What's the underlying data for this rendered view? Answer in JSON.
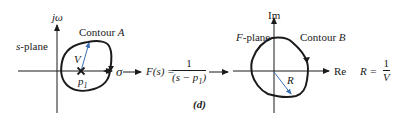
{
  "figure_label": "(d)",
  "s_plane": {
    "plane_label": "s-plane",
    "plane_label_var": "s",
    "plane_label_rest": "-plane",
    "vertical_axis_label": "jω",
    "horizontal_axis_label": "σ",
    "contour_label": "Contour ",
    "contour_letter": "A",
    "vector_label": "V",
    "pole_label": "p",
    "pole_subscript": "1"
  },
  "mapping": {
    "function_lhs": "F(s) = ",
    "numerator": "1",
    "denominator_prefix": "(s − p",
    "denominator_subscript": "1",
    "denominator_suffix": ")"
  },
  "f_plane": {
    "plane_label_var": "F",
    "plane_label_rest": "-plane",
    "vertical_axis_label": "Im",
    "horizontal_axis_label": "Re",
    "contour_label": "Contour ",
    "contour_letter": "B",
    "vector_label": "R"
  },
  "relation": {
    "lhs": "R = ",
    "numerator": "1",
    "denominator": "V"
  },
  "colors": {
    "line": "#1a1a1a",
    "vector": "#3a6fb5"
  }
}
